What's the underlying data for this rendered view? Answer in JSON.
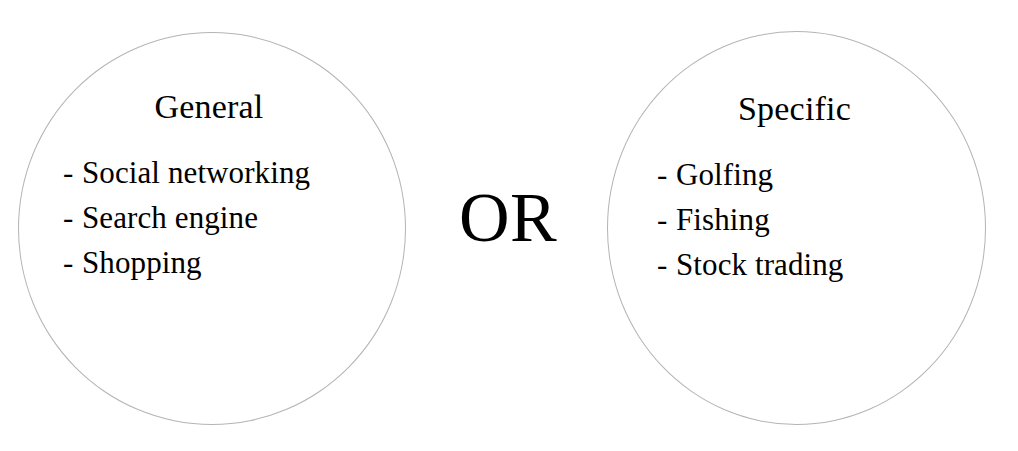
{
  "diagram": {
    "background_color": "#ffffff",
    "text_color": "#000000",
    "circle_stroke_color": "#b4b4b4",
    "connector": {
      "label": "OR"
    },
    "groups": [
      {
        "id": "general",
        "title": "General",
        "bullet": "-",
        "items": [
          "Social networking",
          "Search engine",
          "Shopping"
        ]
      },
      {
        "id": "specific",
        "title": "Specific",
        "bullet": "-",
        "items": [
          "Golfing",
          "Fishing",
          "Stock trading"
        ]
      }
    ]
  }
}
